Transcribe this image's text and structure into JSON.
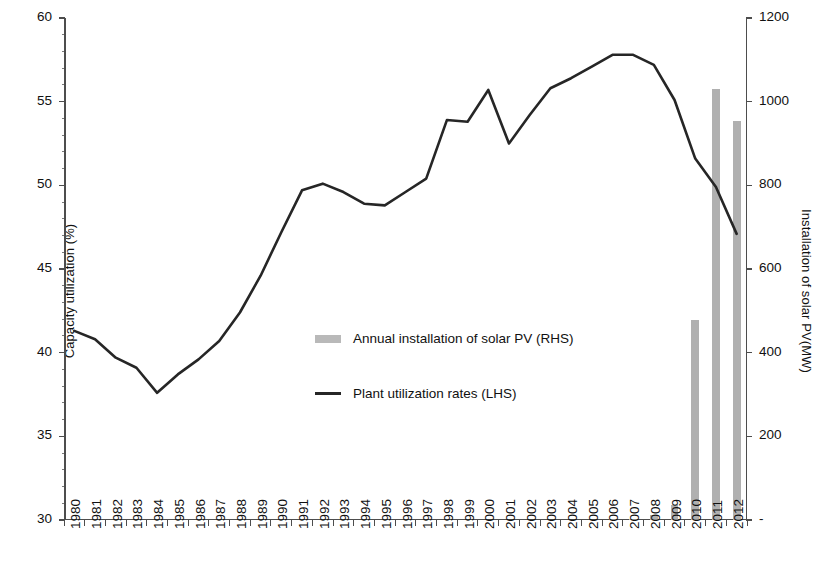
{
  "chart_data": {
    "type": "bar",
    "title": "",
    "xlabel": "",
    "ylabel": "Capacity utilization (%)",
    "y2label": "Installation of solar PV(MW)",
    "grid": false,
    "legend_position": "center",
    "categories": [
      "1980",
      "1981",
      "1982",
      "1983",
      "1984",
      "1985",
      "1986",
      "1987",
      "1988",
      "1989",
      "1990",
      "1991",
      "1992",
      "1993",
      "1994",
      "1995",
      "1996",
      "1997",
      "1998",
      "1999",
      "2000",
      "2001",
      "2002",
      "2003",
      "2004",
      "2005",
      "2006",
      "2007",
      "2008",
      "2009",
      "2010",
      "2011",
      "2012"
    ],
    "ylim": [
      30,
      60
    ],
    "yticks": [
      30,
      35,
      40,
      45,
      50,
      55,
      60
    ],
    "yticklabels": [
      "30",
      "35",
      "40",
      "45",
      "50",
      "55",
      "60"
    ],
    "y2lim": [
      0,
      1200
    ],
    "y2ticks": [
      0,
      200,
      400,
      600,
      800,
      1000,
      1200
    ],
    "y2ticklabels": [
      "-",
      "200",
      "400",
      "600",
      "800",
      "1000",
      "1200"
    ],
    "series": [
      {
        "name": "Annual installation of solar PV (RHS)",
        "type": "bar",
        "axis": "right",
        "color": "#b0b0b0",
        "values": [
          0,
          0,
          0,
          0,
          0,
          0,
          0,
          0,
          0,
          0,
          0,
          0,
          0,
          0,
          0,
          0,
          0,
          0,
          0,
          0,
          0,
          0,
          0,
          0,
          0,
          0,
          1,
          3,
          12,
          35,
          478,
          1030,
          955
        ]
      },
      {
        "name": "Plant utilization rates (LHS)",
        "type": "line",
        "axis": "left",
        "color": "#262626",
        "values": [
          41.3,
          40.8,
          39.7,
          39.1,
          37.6,
          38.7,
          39.6,
          40.7,
          42.4,
          44.6,
          47.2,
          49.7,
          50.1,
          49.6,
          48.9,
          48.8,
          49.6,
          50.4,
          53.9,
          53.8,
          55.7,
          52.5,
          54.2,
          55.8,
          56.4,
          57.1,
          57.8,
          57.8,
          57.2,
          55.1,
          51.6,
          49.9,
          47.1
        ]
      }
    ],
    "legend": [
      {
        "label": "Annual installation of solar PV (RHS)",
        "marker": "bar",
        "color": "#b9b9b9"
      },
      {
        "label": "Plant utilization rates (LHS)",
        "marker": "line",
        "color": "#262626"
      }
    ]
  },
  "colors": {
    "bar": "#b0b0b0",
    "line": "#262626",
    "axis": "#4d4d4d",
    "background": "#ffffff",
    "text": "#111111"
  }
}
